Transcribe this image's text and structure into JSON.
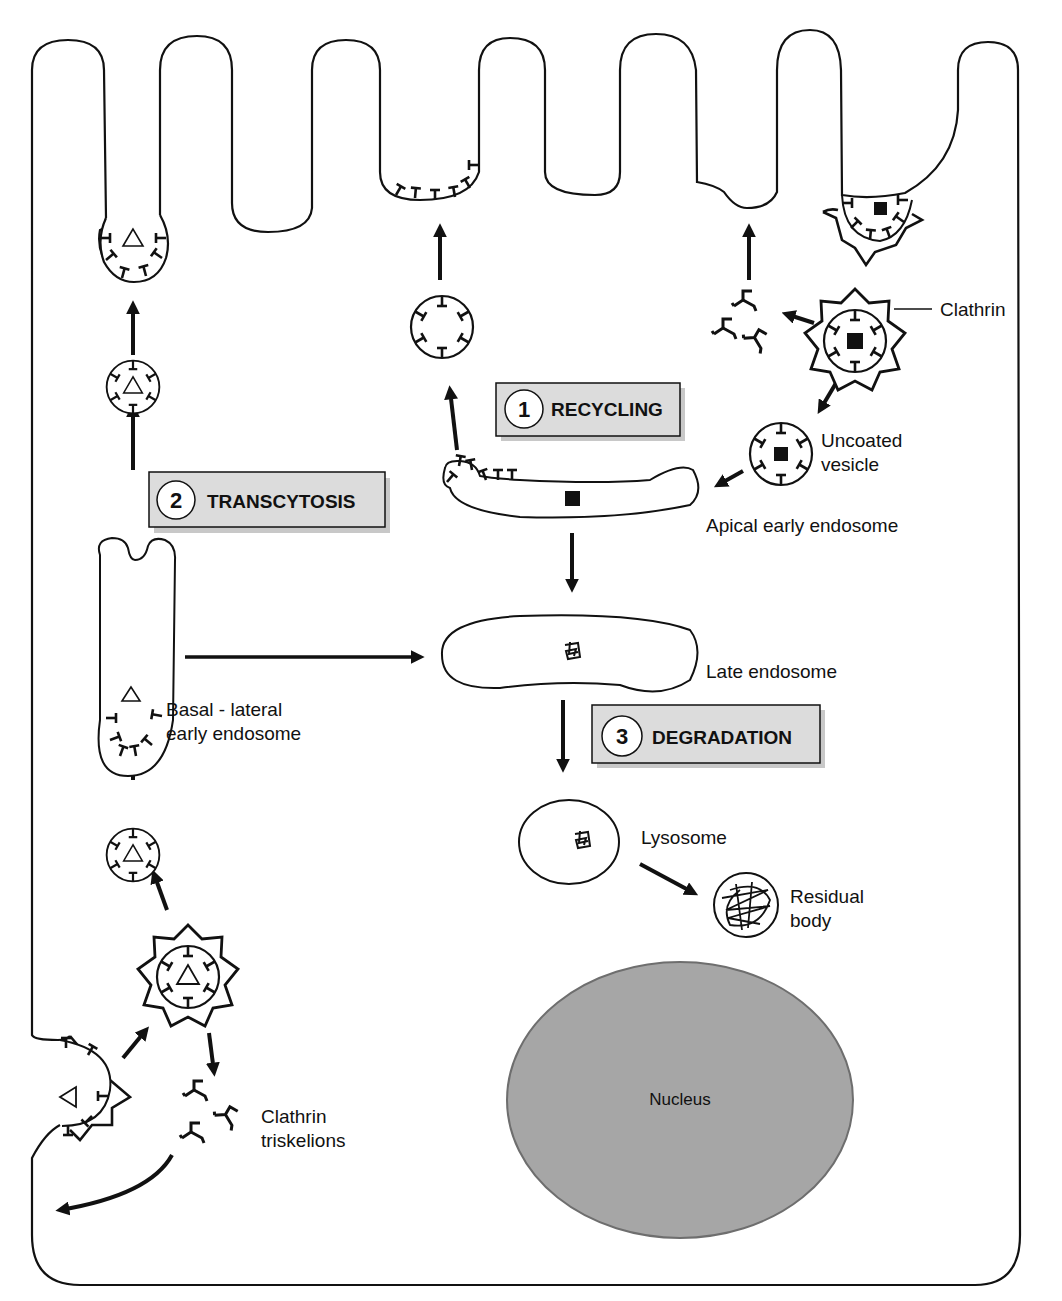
{
  "colors": {
    "stroke": "#111111",
    "background": "#ffffff",
    "label_box_fill": "#dcdcdc",
    "label_box_shadow": "#c8c8c8",
    "nucleus_fill": "#a6a6a6",
    "nucleus_stroke": "#6e6e6e"
  },
  "steps": [
    {
      "number": "1",
      "label": "RECYCLING"
    },
    {
      "number": "2",
      "label": "TRANSCYTOSIS"
    },
    {
      "number": "3",
      "label": "DEGRADATION"
    }
  ],
  "labels": {
    "clathrin": "Clathrin",
    "uncoated_vesicle_line1": "Uncoated",
    "uncoated_vesicle_line2": "vesicle",
    "apical_early_endosome": "Apical early endosome",
    "late_endosome": "Late endosome",
    "basal_lateral_line1": "Basal - lateral",
    "basal_lateral_line2": "early endosome",
    "lysosome": "Lysosome",
    "residual_body_line1": "Residual",
    "residual_body_line2": "body",
    "nucleus": "Nucleus",
    "clathrin_triskelions_line1": "Clathrin",
    "clathrin_triskelions_line2": "triskelions"
  },
  "icons": {
    "triangle_ligand": "triangle-icon",
    "square_ligand": "square-icon",
    "degraded_ligand": "tangled-glyph-icon",
    "receptor": "t-bar-receptor-icon",
    "clathrin_coat": "spiked-star-coat-icon",
    "triskelion": "three-legged-triskelion-icon"
  }
}
